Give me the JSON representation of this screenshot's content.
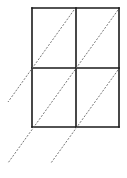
{
  "diagram": {
    "type": "lattice-multiplication-grid",
    "rows": 2,
    "columns": 2,
    "colors": {
      "grid": "#1a1a1a",
      "diagonal": "#666666",
      "background": "#ffffff"
    },
    "grid": {
      "left": 32,
      "right": 119,
      "top": 8,
      "bottom": 127,
      "mid_x": 76,
      "mid_y": 68
    },
    "diagonals": [
      {
        "x1": 74,
        "y1": 10,
        "x2": 8,
        "y2": 102
      },
      {
        "x1": 118,
        "y1": 10,
        "x2": 8,
        "y2": 163
      },
      {
        "x1": 118,
        "y1": 70,
        "x2": 51,
        "y2": 163
      }
    ]
  }
}
